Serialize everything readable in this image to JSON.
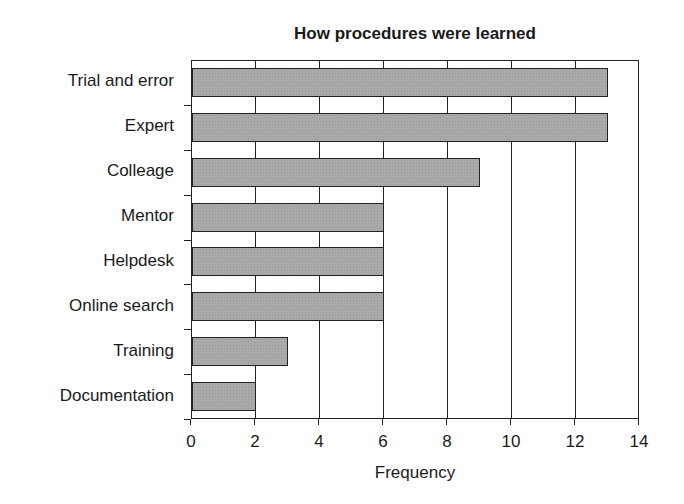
{
  "chart_data": {
    "type": "bar",
    "orientation": "horizontal",
    "title": "How procedures were learned",
    "xlabel": "Frequency",
    "ylabel": "",
    "categories": [
      "Trial and error",
      "Expert",
      "Colleage",
      "Mentor",
      "Helpdesk",
      "Online search",
      "Training",
      "Documentation"
    ],
    "values": [
      13,
      13,
      9,
      6,
      6,
      6,
      3,
      2
    ],
    "xlim": [
      0,
      14
    ],
    "xticks": [
      "0",
      "2",
      "4",
      "6",
      "8",
      "10",
      "12",
      "14"
    ],
    "grid": "vertical lines at each x tick",
    "legend": "none",
    "bar_color": "#a9a9a9",
    "border_color": "#222222"
  }
}
